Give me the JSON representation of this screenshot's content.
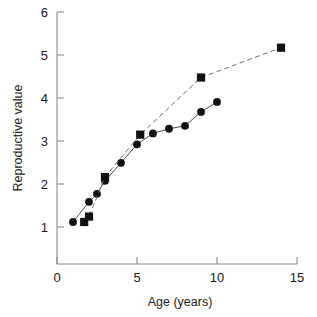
{
  "chart_data": {
    "type": "scatter",
    "title": "",
    "xlabel": "Age (years)",
    "ylabel": "Reproductive value",
    "xlim": [
      0,
      15
    ],
    "ylim": [
      0,
      6
    ],
    "xticks": [
      0,
      5,
      10,
      15
    ],
    "yticks": [
      1,
      2,
      3,
      4,
      5,
      6
    ],
    "xtick_labels": [
      "0",
      "5",
      "10",
      "15"
    ],
    "ytick_labels": [
      "1",
      "2",
      "3",
      "4",
      "5",
      "6"
    ],
    "grid": false,
    "legend": "none",
    "series": [
      {
        "name": "circle-series",
        "marker": "circle",
        "linestyle": "solid",
        "color": "#111111",
        "x": [
          1,
          2,
          2.5,
          3,
          4,
          5,
          6,
          7,
          8,
          9,
          10
        ],
        "y": [
          1.0,
          1.48,
          1.67,
          1.98,
          2.41,
          2.85,
          3.11,
          3.22,
          3.29,
          3.62,
          3.86
        ]
      },
      {
        "name": "square-series",
        "marker": "square",
        "linestyle": "dashed",
        "color": "#111111",
        "x": [
          1.7,
          2.0,
          3.0,
          5.2,
          9.0,
          14.0
        ],
        "y": [
          1.0,
          1.13,
          2.07,
          3.08,
          4.44,
          5.15
        ]
      }
    ]
  },
  "axes": {
    "x_title": "Age (years)",
    "y_title": "Reproductive value"
  }
}
